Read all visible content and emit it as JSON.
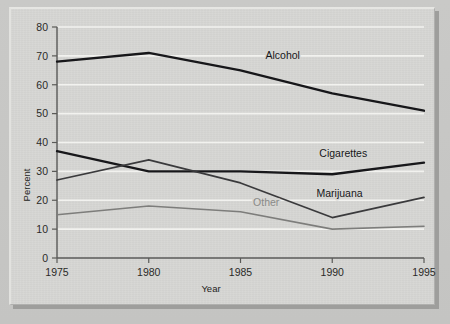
{
  "figure": {
    "background_color": "#c6c6c4",
    "panel_color": "#d6d6d3"
  },
  "chart_data": {
    "type": "line",
    "title": "",
    "subtitle": "",
    "xlabel": "Year",
    "ylabel": "Percent",
    "x": [
      1975,
      1980,
      1985,
      1990,
      1995
    ],
    "xlim": [
      1975,
      1995
    ],
    "ylim": [
      0,
      80
    ],
    "xticks": [
      1975,
      1980,
      1985,
      1990,
      1995
    ],
    "xtick_labels": [
      "1975",
      "1980",
      "1985",
      "1990",
      "1995"
    ],
    "yticks": [
      0,
      10,
      20,
      30,
      40,
      50,
      60,
      70,
      80
    ],
    "ytick_labels": [
      "0",
      "10",
      "20",
      "30",
      "40",
      "50",
      "60",
      "70",
      "80"
    ],
    "grid": "horizontal",
    "grid_color": "#f2f2ef",
    "legend": "inline-labels",
    "series": [
      {
        "name": "Alcohol",
        "color": "#17171a",
        "weight": "heavy",
        "values": [
          68,
          71,
          65,
          57,
          51
        ],
        "label_x": 1987.3,
        "label_y": 69
      },
      {
        "name": "Cigarettes",
        "color": "#17171a",
        "weight": "heavy",
        "values": [
          37,
          30,
          30,
          29,
          33
        ],
        "label_x": 1990.6,
        "label_y": 35
      },
      {
        "name": "Marijuana",
        "color": "#3a3a3c",
        "weight": "medium",
        "values": [
          27,
          34,
          26,
          14,
          21
        ],
        "label_x": 1990.4,
        "label_y": 21
      },
      {
        "name": "Other",
        "color": "#7d7d7b",
        "weight": "light",
        "values": [
          15,
          18,
          16,
          10,
          11
        ],
        "label_x": 1986.4,
        "label_y": 18
      }
    ]
  }
}
